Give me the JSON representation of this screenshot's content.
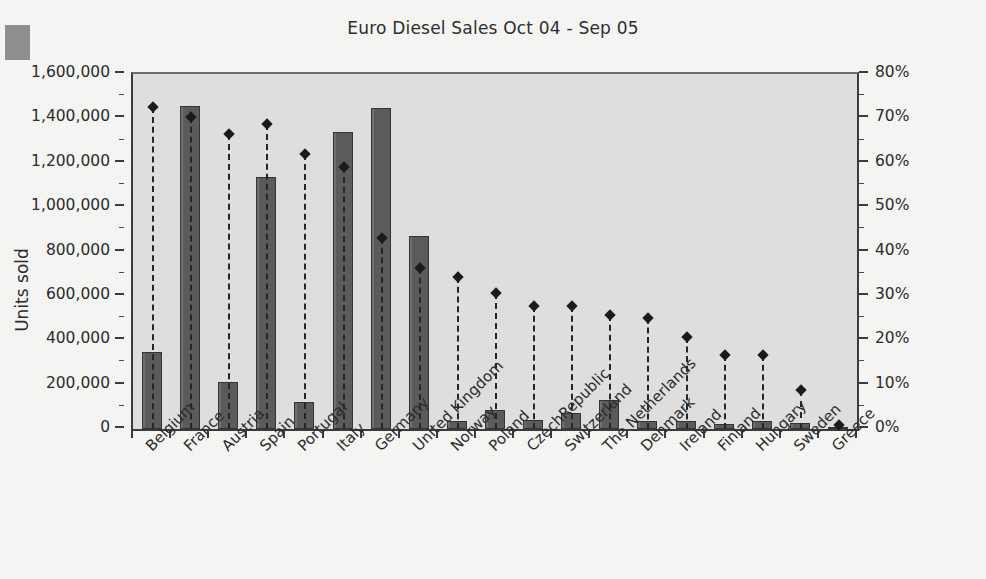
{
  "chart_data": {
    "type": "bar",
    "title": "Euro Diesel Sales Oct 04 - Sep 05",
    "xlabel": "",
    "ylabel": "Units sold",
    "y2label": "Percentage of market",
    "ylim": [
      0,
      1600000
    ],
    "y2lim": [
      0,
      80
    ],
    "grid": false,
    "legend": "none",
    "categories": [
      "Belgium",
      "France",
      "Austria",
      "Spain",
      "Portugal",
      "Italy",
      "Germany",
      "United Kingdom",
      "Norway",
      "Poland",
      "CzechRepublic",
      "Switzerland",
      "The Netherlands",
      "Denmark",
      "Ireland",
      "Finland",
      "Hungary",
      "Sweden",
      "Greece"
    ],
    "series": [
      {
        "name": "Units sold",
        "axis": "left",
        "render": "bar",
        "values": [
          348000,
          1455000,
          210000,
          1138000,
          122000,
          1340000,
          1448000,
          868000,
          38000,
          86000,
          40000,
          74000,
          130000,
          36000,
          36000,
          22000,
          38000,
          25000,
          6000
        ]
      },
      {
        "name": "Percentage of market",
        "axis": "right",
        "render": "marker-stem",
        "values": [
          72.5,
          70.3,
          66.5,
          68.8,
          62.0,
          59.0,
          43.0,
          36.3,
          34.3,
          30.7,
          27.7,
          27.7,
          25.7,
          25.0,
          20.7,
          16.7,
          16.7,
          8.8,
          1.0
        ]
      }
    ],
    "y_ticks_left": [
      "0",
      "200,000",
      "400,000",
      "600,000",
      "800,000",
      "1,000,000",
      "1,200,000",
      "1,400,000",
      "1,600,000"
    ],
    "y_ticks_right": [
      "0%",
      "10%",
      "20%",
      "30%",
      "40%",
      "50%",
      "60%",
      "70%",
      "80%"
    ],
    "colors": {
      "bar_fill": "#5b5b5b",
      "bar_edge": "#343434",
      "marker": "#1b1b1b",
      "stem": "#262626",
      "plot_background": "#dedede",
      "page_background": "#f6f6f4",
      "axis": "#3b3b3b",
      "text": "#2b2b2b"
    }
  }
}
